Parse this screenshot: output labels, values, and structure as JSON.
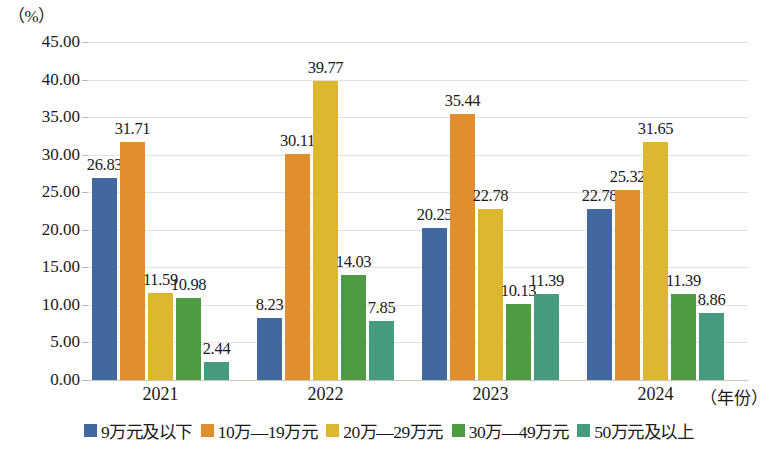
{
  "chart_data": {
    "type": "bar",
    "title": "",
    "subtitle": "",
    "xlabel": "（年份）",
    "ylabel": "（%）",
    "ylim": [
      0,
      45
    ],
    "ytick_step": 5,
    "yticks": [
      "0.00",
      "5.00",
      "10.00",
      "15.00",
      "20.00",
      "25.00",
      "30.00",
      "35.00",
      "40.00",
      "45.00"
    ],
    "grid": true,
    "legend_position": "bottom",
    "categories": [
      "2021",
      "2022",
      "2023",
      "2024"
    ],
    "series": [
      {
        "name": "9万元及以下",
        "color": "#41689f",
        "values": [
          26.83,
          8.23,
          20.25,
          22.78
        ],
        "labels": [
          "26.83",
          "8.23",
          "20.25",
          "22.78"
        ]
      },
      {
        "name": "10万—19万元",
        "color": "#e08e30",
        "values": [
          31.71,
          30.11,
          35.44,
          25.32
        ],
        "labels": [
          "31.71",
          "30.11",
          "35.44",
          "25.32"
        ]
      },
      {
        "name": "20万—29万元",
        "color": "#ddb72f",
        "values": [
          11.59,
          39.77,
          22.78,
          31.65
        ],
        "labels": [
          "11.59",
          "39.77",
          "22.78",
          "31.65"
        ]
      },
      {
        "name": "30万—49万元",
        "color": "#4e9b41",
        "values": [
          10.98,
          14.03,
          10.13,
          11.39
        ],
        "labels": [
          "10.98",
          "14.03",
          "10.13",
          "11.39"
        ]
      },
      {
        "name": "50万元及以上",
        "color": "#479c7f",
        "values": [
          2.44,
          7.85,
          11.39,
          8.86
        ],
        "labels": [
          "2.44",
          "7.85",
          "11.39",
          "8.86"
        ]
      }
    ]
  }
}
